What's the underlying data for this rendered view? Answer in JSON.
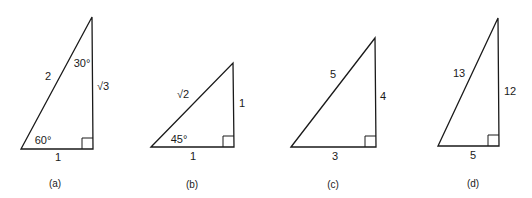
{
  "figure": {
    "triangles": [
      {
        "id": "a",
        "caption": "(a)",
        "hypotenuse": "2",
        "vertical_side": "√3",
        "base": "1",
        "top_angle": "30°",
        "bottom_angle": "60°",
        "right_angle_marker": true
      },
      {
        "id": "b",
        "caption": "(b)",
        "hypotenuse": "√2",
        "vertical_side": "1",
        "base": "1",
        "bottom_angle": "45°",
        "right_angle_marker": true
      },
      {
        "id": "c",
        "caption": "(c)",
        "hypotenuse": "5",
        "vertical_side": "4",
        "base": "3",
        "right_angle_marker": true
      },
      {
        "id": "d",
        "caption": "(d)",
        "hypotenuse": "13",
        "vertical_side": "12",
        "base": "5",
        "right_angle_marker": true
      }
    ]
  }
}
